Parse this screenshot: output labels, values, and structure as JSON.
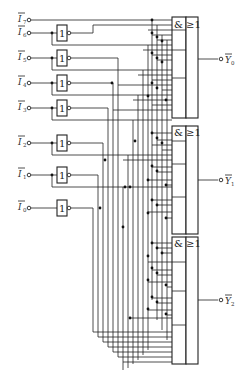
{
  "diagram": {
    "inputs": [
      {
        "name": "I7",
        "label": "I",
        "sub": "7",
        "inverted_bar": true
      },
      {
        "name": "I6",
        "label": "I",
        "sub": "6",
        "inverted_bar": true
      },
      {
        "name": "I5",
        "label": "I",
        "sub": "5",
        "inverted_bar": true
      },
      {
        "name": "I4",
        "label": "I",
        "sub": "4",
        "inverted_bar": true
      },
      {
        "name": "I3",
        "label": "I",
        "sub": "3",
        "inverted_bar": true
      },
      {
        "name": "I2",
        "label": "I",
        "sub": "2",
        "inverted_bar": true
      },
      {
        "name": "I1",
        "label": "I",
        "sub": "1",
        "inverted_bar": true
      },
      {
        "name": "I0",
        "label": "I",
        "sub": "0",
        "inverted_bar": true
      }
    ],
    "inverter_label": "1",
    "gates": [
      {
        "name": "AND-OR-INVERT Y0",
        "and_symbol": "&",
        "or_symbol": "≥1"
      },
      {
        "name": "AND-OR-INVERT Y1",
        "and_symbol": "&",
        "or_symbol": "≥1"
      },
      {
        "name": "AND-OR-INVERT Y2",
        "and_symbol": "&",
        "or_symbol": "≥1"
      }
    ],
    "outputs": [
      {
        "name": "Y0",
        "label": "Y",
        "sub": "0",
        "inverted_bar": true
      },
      {
        "name": "Y1",
        "label": "Y",
        "sub": "1",
        "inverted_bar": true
      },
      {
        "name": "Y2",
        "label": "Y",
        "sub": "2",
        "inverted_bar": true
      }
    ]
  }
}
